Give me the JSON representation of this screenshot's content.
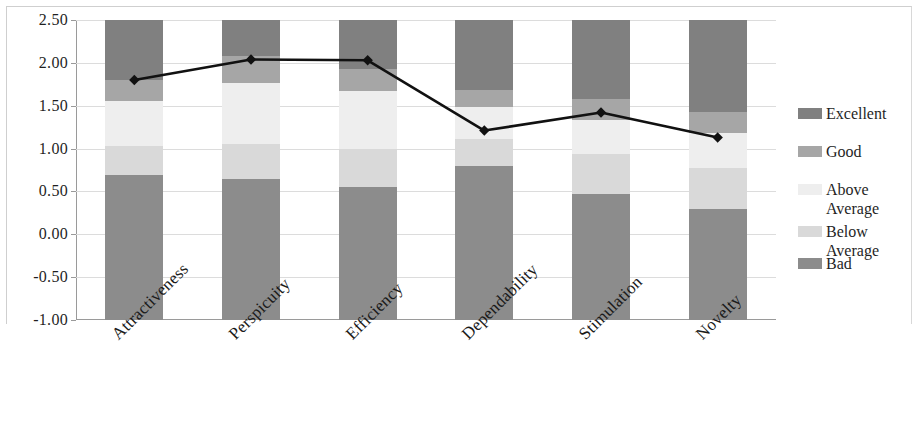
{
  "chart_data": {
    "type": "bar",
    "title": "",
    "subtitle": "",
    "xlabel": "",
    "ylabel": "",
    "ylim": [
      -1.0,
      2.5
    ],
    "ytick_step": 0.5,
    "grid": true,
    "legend_position": "right",
    "categories": [
      "Attractiveness",
      "Perspicuity",
      "Efficiency",
      "Dependability",
      "Stimulation",
      "Novelty"
    ],
    "ytick_labels": [
      "2.50",
      "2.00",
      "1.50",
      "1.00",
      "0.50",
      "0.00",
      "-0.50",
      "-1.00"
    ],
    "ytick_values": [
      2.5,
      2.0,
      1.5,
      1.0,
      0.5,
      0.0,
      -0.5,
      -1.0
    ],
    "benchmark_bands": [
      {
        "name": "Excellent",
        "color": "#808080"
      },
      {
        "name": "Good",
        "color": "#a6a6a6"
      },
      {
        "name": "Above\nAverage",
        "color": "#eeeeee"
      },
      {
        "name": "Below\nAverage",
        "color": "#d9d9d9"
      },
      {
        "name": "Bad",
        "color": "#8c8c8c"
      }
    ],
    "band_boundaries": [
      {
        "category": "Attractiveness",
        "excellent_top": 2.5,
        "good_top": 1.8,
        "above_average_top": 1.55,
        "below_average_top": 1.03,
        "bad_top": 0.69,
        "bottom": -1.0
      },
      {
        "category": "Perspicuity",
        "excellent_top": 2.5,
        "good_top": 2.08,
        "above_average_top": 1.77,
        "below_average_top": 1.05,
        "bad_top": 0.64,
        "bottom": -1.0
      },
      {
        "category": "Efficiency",
        "excellent_top": 2.5,
        "good_top": 1.93,
        "above_average_top": 1.67,
        "below_average_top": 1.0,
        "bad_top": 0.55,
        "bottom": -1.0
      },
      {
        "category": "Dependability",
        "excellent_top": 2.5,
        "good_top": 1.68,
        "above_average_top": 1.48,
        "below_average_top": 1.11,
        "bad_top": 0.8,
        "bottom": -1.0
      },
      {
        "category": "Stimulation",
        "excellent_top": 2.5,
        "good_top": 1.58,
        "above_average_top": 1.33,
        "below_average_top": 0.94,
        "bad_top": 0.47,
        "bottom": -1.0
      },
      {
        "category": "Novelty",
        "excellent_top": 2.5,
        "good_top": 1.43,
        "above_average_top": 1.18,
        "below_average_top": 0.77,
        "bad_top": 0.3,
        "bottom": -1.0
      }
    ],
    "series": [
      {
        "name": "Measured",
        "marker": "diamond",
        "color": "#111111",
        "values": [
          1.8,
          2.04,
          2.03,
          1.21,
          1.42,
          1.13
        ]
      }
    ]
  },
  "legend": {
    "items": [
      {
        "label": "Excellent",
        "color": "#808080"
      },
      {
        "label": "Good",
        "color": "#a6a6a6"
      },
      {
        "label": "Above\nAverage",
        "color": "#eeeeee"
      },
      {
        "label": "Below\nAverage",
        "color": "#d9d9d9"
      },
      {
        "label": "Bad",
        "color": "#8c8c8c"
      }
    ]
  }
}
